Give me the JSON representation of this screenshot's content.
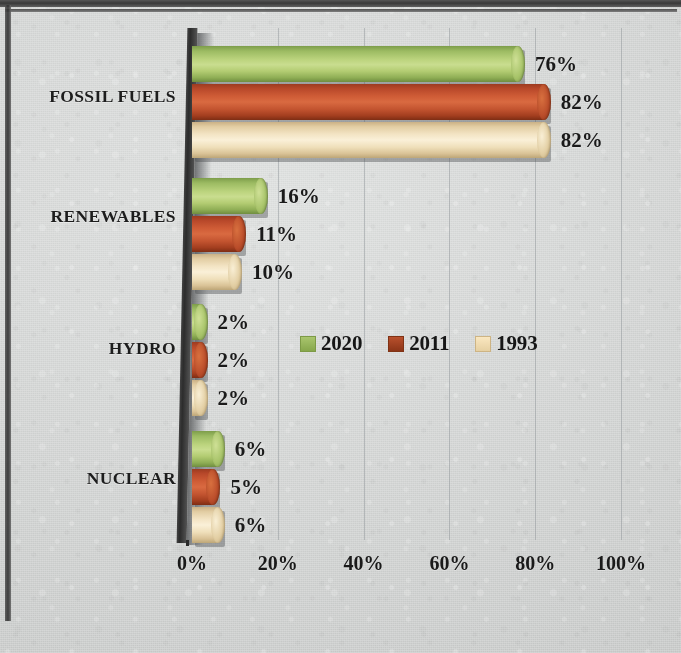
{
  "chart_data": {
    "type": "bar",
    "orientation": "horizontal",
    "title": "",
    "subtitle": "",
    "xlabel": "",
    "ylabel": "",
    "categories": [
      "FOSSIL FUELS",
      "RENEWABLES",
      "HYDRO",
      "NUCLEAR"
    ],
    "series": [
      {
        "name": "2020",
        "color": "#a9c56d",
        "values": [
          76,
          16,
          2,
          6
        ],
        "labels": [
          "76%",
          "16%",
          "2%",
          "6%"
        ]
      },
      {
        "name": "2011",
        "color": "#b9502d",
        "values": [
          82,
          11,
          2,
          5
        ],
        "labels": [
          "82%",
          "11%",
          "2%",
          "5%"
        ]
      },
      {
        "name": "1993",
        "color": "#f3e1bb",
        "values": [
          82,
          10,
          2,
          6
        ],
        "labels": [
          "82%",
          "10%",
          "2%",
          "6%"
        ]
      }
    ],
    "xlim": [
      0,
      100
    ],
    "xticks": [
      0,
      20,
      40,
      60,
      80,
      100
    ],
    "xtick_labels": [
      "0%",
      "20%",
      "40%",
      "60%",
      "80%",
      "100%"
    ],
    "value_suffix": "%",
    "grid": true,
    "grid_axis": "x",
    "legend_position": "middle-center",
    "style": "3d-cylinder"
  },
  "axis": {
    "ticks": [
      {
        "label": "0%",
        "value": 0
      },
      {
        "label": "20%",
        "value": 20
      },
      {
        "label": "40%",
        "value": 40
      },
      {
        "label": "60%",
        "value": 60
      },
      {
        "label": "80%",
        "value": 80
      },
      {
        "label": "100%",
        "value": 100
      }
    ]
  },
  "legend": {
    "items": [
      {
        "label": "2020",
        "swatch": "swatch-2020-icon"
      },
      {
        "label": "2011",
        "swatch": "swatch-2011-icon"
      },
      {
        "label": "1993",
        "swatch": "swatch-1993-icon"
      }
    ]
  },
  "groups": [
    {
      "category": "FOSSIL FUELS",
      "bars": [
        {
          "series": "2020",
          "value": 76,
          "label": "76%"
        },
        {
          "series": "2011",
          "value": 82,
          "label": "82%"
        },
        {
          "series": "1993",
          "value": 82,
          "label": "82%"
        }
      ]
    },
    {
      "category": "RENEWABLES",
      "bars": [
        {
          "series": "2020",
          "value": 16,
          "label": "16%"
        },
        {
          "series": "2011",
          "value": 11,
          "label": "11%"
        },
        {
          "series": "1993",
          "value": 10,
          "label": "10%"
        }
      ]
    },
    {
      "category": "HYDRO",
      "bars": [
        {
          "series": "2020",
          "value": 2,
          "label": "2%"
        },
        {
          "series": "2011",
          "value": 2,
          "label": "2%"
        },
        {
          "series": "1993",
          "value": 2,
          "label": "2%"
        }
      ]
    },
    {
      "category": "NUCLEAR",
      "bars": [
        {
          "series": "2020",
          "value": 6,
          "label": "6%"
        },
        {
          "series": "2011",
          "value": 5,
          "label": "5%"
        },
        {
          "series": "1993",
          "value": 6,
          "label": "6%"
        }
      ]
    }
  ],
  "colors": {
    "series_2020": "#a9c56d",
    "series_2011": "#b9502d",
    "series_1993": "#f3e1bb",
    "background": "#cfd1d0",
    "text": "#1a1a1a",
    "axis_wall": "#2b2b2b",
    "gridline": "#969b9e"
  }
}
